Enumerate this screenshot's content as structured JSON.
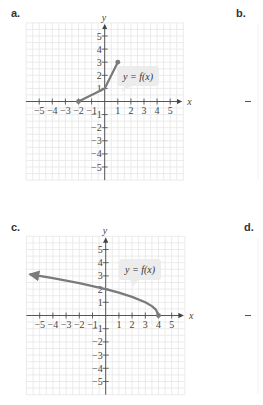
{
  "panels": {
    "a": {
      "label": "a."
    },
    "b": {
      "label": "b."
    },
    "c": {
      "label": "c."
    },
    "d": {
      "label": "d."
    }
  },
  "chart_data": [
    {
      "panel": "a",
      "type": "line",
      "title": "",
      "xlabel": "x",
      "ylabel": "y",
      "xlim": [
        -6,
        6
      ],
      "ylim": [
        -6,
        6
      ],
      "grid": true,
      "xticks": [
        -5,
        -4,
        -3,
        -2,
        -1,
        1,
        2,
        3,
        4,
        5
      ],
      "yticks": [
        -5,
        -4,
        -3,
        -2,
        -1,
        1,
        2,
        3,
        4,
        5
      ],
      "xtick_labels": [
        "−5",
        "−4",
        "−3",
        "−2",
        "−1",
        "1",
        "2",
        "3",
        "4",
        "5"
      ],
      "ytick_labels": [
        "−5",
        "−4",
        "−3",
        "−2",
        "−1",
        "1",
        "2",
        "3",
        "4",
        "5"
      ],
      "annotation": "y = f(x)",
      "series": [
        {
          "name": "f(x)",
          "points": [
            [
              -2,
              0
            ],
            [
              0,
              1
            ],
            [
              1,
              3
            ]
          ],
          "endpoints": "closed-dots",
          "arrow_left": false
        }
      ]
    },
    {
      "panel": "c",
      "type": "line",
      "title": "",
      "xlabel": "x",
      "ylabel": "y",
      "xlim": [
        -6,
        6
      ],
      "ylim": [
        -6,
        6
      ],
      "grid": true,
      "xticks": [
        -5,
        -4,
        -3,
        -2,
        -1,
        1,
        2,
        3,
        4,
        5
      ],
      "yticks": [
        -5,
        -4,
        -3,
        -2,
        -1,
        1,
        2,
        3,
        4,
        5
      ],
      "xtick_labels": [
        "−5",
        "−4",
        "−3",
        "−2",
        "−1",
        "1",
        "2",
        "3",
        "4",
        "5"
      ],
      "ytick_labels": [
        "−5",
        "−4",
        "−3",
        "−2",
        "−1",
        "1",
        "2",
        "3",
        "4",
        "5"
      ],
      "annotation": "y = f(x)",
      "series": [
        {
          "name": "f(x)",
          "points": [
            [
              -5.7,
              3.11
            ],
            [
              -4,
              2.83
            ],
            [
              -2,
              2.45
            ],
            [
              0,
              2
            ],
            [
              1,
              1.73
            ],
            [
              2,
              1.41
            ],
            [
              3,
              1
            ],
            [
              3.5,
              0.71
            ],
            [
              3.8,
              0.45
            ],
            [
              4,
              0
            ]
          ],
          "endpoints": "right-closed-dot",
          "arrow_left": true
        }
      ]
    }
  ]
}
